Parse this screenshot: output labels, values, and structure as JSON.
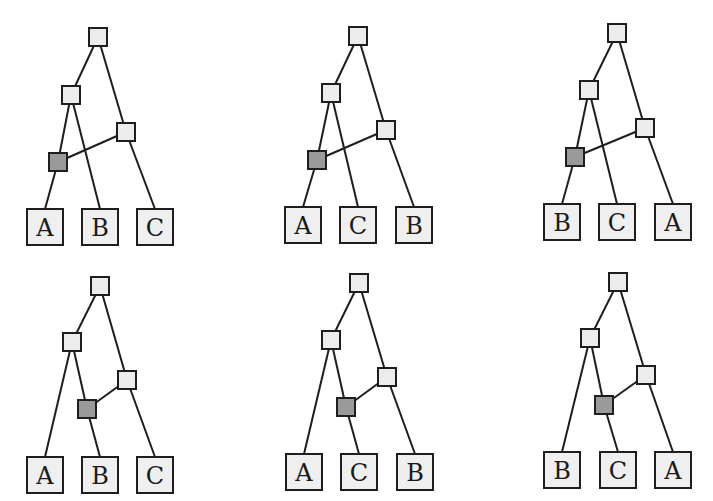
{
  "figure": {
    "colors": {
      "edge": "#1e1e1e",
      "tree_node": "#ececec",
      "reticulation_node": "#9a9a9a",
      "leaf": "#efefef"
    },
    "panels": [
      {
        "id": "p1",
        "hybrid_variant": "left",
        "root": [
          98,
          37
        ],
        "mid": [
          71,
          95
        ],
        "right": [
          126,
          132
        ],
        "hybrid": [
          58,
          162
        ],
        "leaves": [
          {
            "label": "A",
            "x": 45,
            "y": 227
          },
          {
            "label": "B",
            "x": 100,
            "y": 227
          },
          {
            "label": "C",
            "x": 155,
            "y": 227
          }
        ]
      },
      {
        "id": "p2",
        "hybrid_variant": "left",
        "root": [
          358,
          36
        ],
        "mid": [
          331,
          93
        ],
        "right": [
          386,
          130
        ],
        "hybrid": [
          317,
          160
        ],
        "leaves": [
          {
            "label": "A",
            "x": 303,
            "y": 225
          },
          {
            "label": "C",
            "x": 358,
            "y": 225
          },
          {
            "label": "B",
            "x": 414,
            "y": 225
          }
        ]
      },
      {
        "id": "p3",
        "hybrid_variant": "left",
        "root": [
          617,
          33
        ],
        "mid": [
          589,
          90
        ],
        "right": [
          645,
          128
        ],
        "hybrid": [
          575,
          157
        ],
        "leaves": [
          {
            "label": "B",
            "x": 562,
            "y": 222
          },
          {
            "label": "C",
            "x": 617,
            "y": 222
          },
          {
            "label": "A",
            "x": 673,
            "y": 222
          }
        ]
      },
      {
        "id": "p4",
        "hybrid_variant": "middle",
        "root": [
          100,
          286
        ],
        "mid": [
          72,
          342
        ],
        "right": [
          127,
          380
        ],
        "hybrid": [
          87,
          409
        ],
        "leaves": [
          {
            "label": "A",
            "x": 45,
            "y": 475
          },
          {
            "label": "B",
            "x": 100,
            "y": 475
          },
          {
            "label": "C",
            "x": 155,
            "y": 475
          }
        ]
      },
      {
        "id": "p5",
        "hybrid_variant": "middle",
        "root": [
          359,
          283
        ],
        "mid": [
          331,
          340
        ],
        "right": [
          387,
          377
        ],
        "hybrid": [
          346,
          407
        ],
        "leaves": [
          {
            "label": "A",
            "x": 304,
            "y": 472
          },
          {
            "label": "C",
            "x": 359,
            "y": 472
          },
          {
            "label": "B",
            "x": 415,
            "y": 472
          }
        ]
      },
      {
        "id": "p6",
        "hybrid_variant": "middle",
        "root": [
          618,
          282
        ],
        "mid": [
          590,
          338
        ],
        "right": [
          646,
          375
        ],
        "hybrid": [
          604,
          405
        ],
        "leaves": [
          {
            "label": "B",
            "x": 562,
            "y": 470
          },
          {
            "label": "C",
            "x": 618,
            "y": 470
          },
          {
            "label": "A",
            "x": 673,
            "y": 470
          }
        ]
      }
    ],
    "sizes": {
      "internal_node": 18,
      "leaf_node": 36
    }
  }
}
